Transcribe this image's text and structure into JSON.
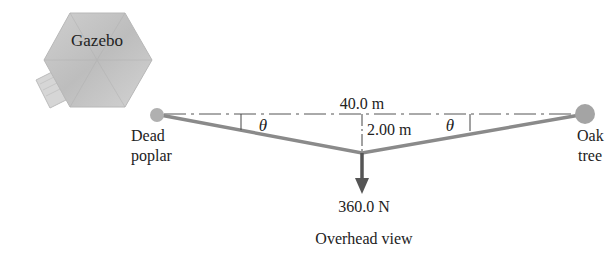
{
  "gazebo": {
    "label": "Gazebo"
  },
  "labels": {
    "span": "40.0 m",
    "sag": "2.00 m",
    "angle_left": "θ",
    "angle_right": "θ",
    "left_anchor_line1": "Dead",
    "left_anchor_line2": "poplar",
    "right_anchor_line1": "Oak",
    "right_anchor_line2": "tree",
    "force": "360.0 N",
    "caption": "Overhead view"
  },
  "colors": {
    "rope": "#8a8a8a",
    "tree": "#a8a8a8",
    "arrow": "#555555",
    "gazebo": "#c4c4c4"
  }
}
